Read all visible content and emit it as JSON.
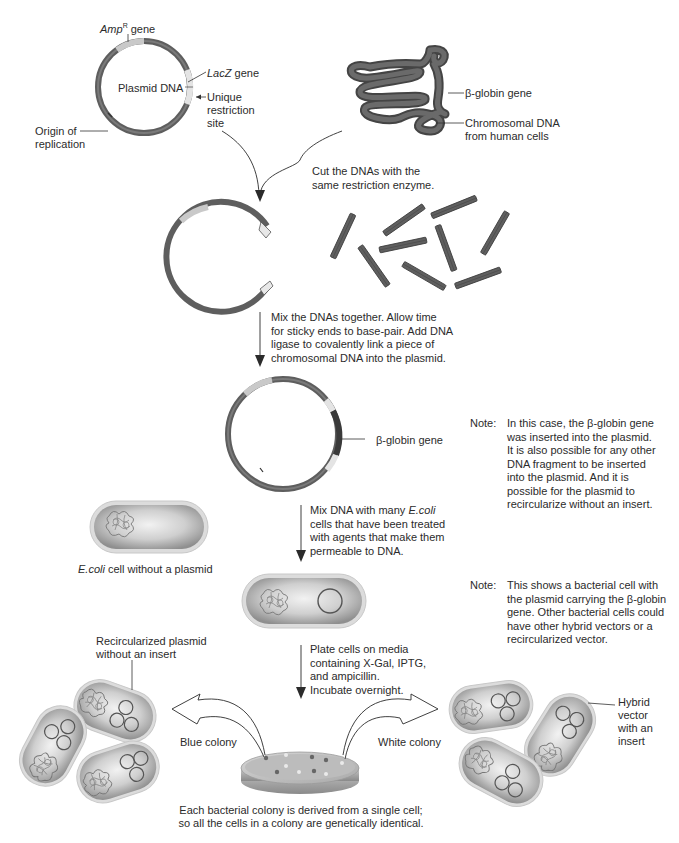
{
  "diagram": {
    "type": "process-flow",
    "topic": "Cloning a human gene into a bacterial plasmid",
    "colors": {
      "dna_strand": "#5d5d5d",
      "dna_dark": "#3f3f3f",
      "plasmid_light_segment": "#c8c8c8",
      "lacz_segment": "#e6e6e6",
      "insert_segment": "#3a3a3a",
      "cell_fill": "#bdbdbd",
      "cell_highlight": "#ececec",
      "cell_border": "#d9d9d9",
      "arrow": "#2b2b2b",
      "text": "#2b2b2b"
    }
  },
  "plasmid": {
    "title": "Plasmid DNA",
    "amp_gene_italic": "Amp",
    "amp_gene_sup": "R",
    "amp_gene_suffix": " gene",
    "lacz_italic": "LacZ",
    "lacz_suffix": " gene",
    "restriction_site": "Unique\nrestriction\nsite",
    "origin": "Origin of\nreplication"
  },
  "chromosome": {
    "globin_label": "β-globin gene",
    "chromosomal_label": "Chromosomal DNA\nfrom human cells"
  },
  "steps": [
    {
      "id": 1,
      "text": "Cut the DNAs with the\nsame restriction enzyme."
    },
    {
      "id": 2,
      "text": "Mix the DNAs together. Allow time\nfor sticky ends to base-pair. Add DNA\nligase to covalently link a piece of\nchromosomal DNA into the plasmid."
    },
    {
      "id": 3,
      "text_a": "Mix DNA with many ",
      "text_italic": "E.coli",
      "text_b": "\ncells that have been treated\nwith agents that make them\npermeable to DNA."
    },
    {
      "id": 4,
      "text": "Plate cells on media\ncontaining X-Gal, IPTG,\nand ampicillin.\nIncubate overnight."
    }
  ],
  "hybrid_plasmid": {
    "globin_label": "β-globin gene"
  },
  "notes": [
    {
      "tag": "Note:",
      "text": "In this case, the β-globin gene\nwas inserted into the plasmid.\nIt is also possible for any other\nDNA fragment to be inserted\ninto the plasmid. And it is\npossible for the plasmid to\nrecircularize without an insert."
    },
    {
      "tag": "Note:",
      "text": "This shows a bacterial cell with\nthe plasmid carrying the β-globin\ngene. Other bacterial cells could\nhave other hybrid vectors or a\nrecircularized vector."
    }
  ],
  "cells": {
    "no_plasmid_italic": "E.coli",
    "no_plasmid_suffix": " cell without a plasmid"
  },
  "colonies": {
    "blue_label": "Blue colony",
    "white_label": "White colony",
    "recircularized_label": "Recircularized plasmid\nwithout an insert",
    "hybrid_label": "Hybrid\nvector\nwith an\ninsert",
    "caption": "Each bacterial colony is derived from a single cell;\nso all the cells in a colony are genetically identical."
  }
}
